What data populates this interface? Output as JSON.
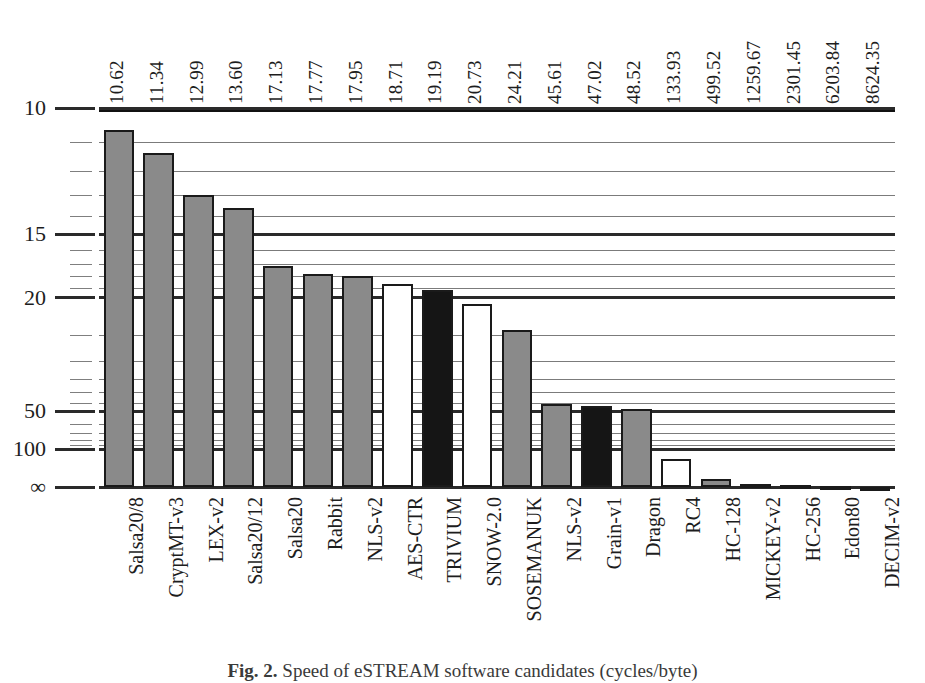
{
  "figure": {
    "caption_label": "Fig. 2.",
    "caption_text": "Speed of eSTREAM software candidates (cycles/byte)"
  },
  "chart_data": {
    "type": "bar",
    "title": "",
    "xlabel": "",
    "ylabel": "",
    "orientation": "vertical",
    "scale": "reciprocal (1/value), inverted axis",
    "grid": true,
    "legend": "none",
    "axis": {
      "y_major_ticks": [
        10,
        15,
        20,
        50,
        100,
        "∞"
      ],
      "y_major_tick_labels": [
        "10",
        "15",
        "20",
        "50",
        "100",
        "∞"
      ],
      "y_minor_ticks": [
        11,
        12,
        13,
        14,
        16,
        17,
        18,
        19,
        25,
        30,
        35,
        40,
        45,
        60,
        70,
        80,
        90
      ],
      "y_top_value": 10,
      "y_bottom_value": "∞"
    },
    "categories": [
      "Salsa20/8",
      "CryptMT-v3",
      "LEX-v2",
      "Salsa20/12",
      "Salsa20",
      "Rabbit",
      "NLS-v2",
      "AES-CTR",
      "TRIVIUM",
      "SNOW-2.0",
      "SOSEMANUK",
      "NLS-v2",
      "Grain-v1",
      "Dragon",
      "RC4",
      "HC-128",
      "MICKEY-v2",
      "HC-256",
      "Edon80",
      "DECIM-v2"
    ],
    "values": [
      10.62,
      11.34,
      12.99,
      13.6,
      17.13,
      17.77,
      17.95,
      18.71,
      19.19,
      20.73,
      24.21,
      45.61,
      47.02,
      48.52,
      133.93,
      499.52,
      1259.67,
      2301.45,
      6203.84,
      8624.35
    ],
    "value_labels": [
      "10.62",
      "11.34",
      "12.99",
      "13.60",
      "17.13",
      "17.77",
      "17.95",
      "18.71",
      "19.19",
      "20.73",
      "24.21",
      "45.61",
      "47.02",
      "48.52",
      "133.93",
      "499.52",
      "1259.67",
      "2301.45",
      "6203.84",
      "8624.35"
    ],
    "bar_styles": [
      "gray",
      "gray",
      "gray",
      "gray",
      "gray",
      "gray",
      "gray",
      "white",
      "black",
      "white",
      "gray",
      "gray",
      "black",
      "gray",
      "white",
      "gray",
      "gray",
      "gray",
      "gray",
      "gray"
    ],
    "colors": {
      "gray": "#8a8a8a",
      "white": "#ffffff",
      "black": "#151515",
      "outline": "#1a1a1a",
      "grid": "#2a2a2a",
      "text": "#1d1d1d"
    }
  }
}
